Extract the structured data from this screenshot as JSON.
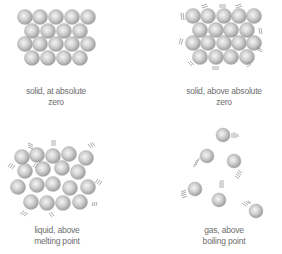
{
  "panels": [
    {
      "id": "solid-zero",
      "label_line1": "solid, at absolute",
      "label_line2": "zero",
      "center_x": 56,
      "label_y": 86
    },
    {
      "id": "solid-above",
      "label_line1": "solid, above absolute",
      "label_line2": "zero",
      "center_x": 224,
      "label_y": 86
    },
    {
      "id": "liquid",
      "label_line1": "liquid, above",
      "label_line2": "melting point",
      "center_x": 57,
      "label_y": 225
    },
    {
      "id": "gas",
      "label_line1": "gas, above",
      "label_line2": "boiling point",
      "center_x": 224,
      "label_y": 225
    }
  ],
  "colors": {
    "sphere_light": "#f2f2f2",
    "sphere_dark": "#9a9a9a",
    "motion_lines": "#8a8a8a",
    "text": "#6e6e6e"
  },
  "spheres": {
    "solid_zero": [
      [
        25,
        17
      ],
      [
        40,
        17
      ],
      [
        56,
        17
      ],
      [
        72,
        17
      ],
      [
        88,
        17
      ],
      [
        32,
        31
      ],
      [
        48,
        31
      ],
      [
        64,
        31
      ],
      [
        80,
        31
      ],
      [
        25,
        44
      ],
      [
        40,
        44
      ],
      [
        56,
        44
      ],
      [
        72,
        44
      ],
      [
        88,
        44
      ],
      [
        32,
        58
      ],
      [
        48,
        58
      ],
      [
        64,
        58
      ],
      [
        80,
        58
      ]
    ],
    "solid_above": [
      [
        193,
        16
      ],
      [
        208,
        16
      ],
      [
        224,
        16
      ],
      [
        239,
        16
      ],
      [
        254,
        16
      ],
      [
        200,
        30
      ],
      [
        216,
        30
      ],
      [
        231,
        30
      ],
      [
        247,
        30
      ],
      [
        193,
        43
      ],
      [
        208,
        43
      ],
      [
        224,
        43
      ],
      [
        239,
        43
      ],
      [
        254,
        43
      ],
      [
        200,
        57
      ],
      [
        216,
        57
      ],
      [
        231,
        57
      ],
      [
        247,
        57
      ]
    ],
    "liquid": [
      [
        22,
        157
      ],
      [
        37,
        155
      ],
      [
        53,
        156
      ],
      [
        69,
        154
      ],
      [
        86,
        158
      ],
      [
        25,
        171
      ],
      [
        43,
        169
      ],
      [
        62,
        168
      ],
      [
        78,
        172
      ],
      [
        18,
        187
      ],
      [
        37,
        185
      ],
      [
        53,
        184
      ],
      [
        70,
        188
      ],
      [
        88,
        187
      ],
      [
        31,
        202
      ],
      [
        47,
        203
      ],
      [
        63,
        203
      ],
      [
        80,
        202
      ]
    ],
    "gas": [
      [
        223,
        135
      ],
      [
        207,
        156
      ],
      [
        234,
        161
      ],
      [
        195,
        189
      ],
      [
        219,
        200
      ],
      [
        256,
        211
      ]
    ]
  }
}
